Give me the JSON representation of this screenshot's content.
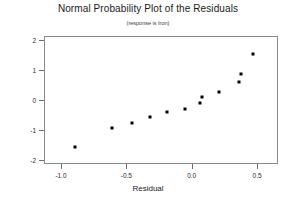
{
  "chart_data": {
    "type": "scatter",
    "title": "Normal Probability Plot of the Residuals",
    "subtitle": "(response is Iron)",
    "xlabel": "Residual",
    "ylabel": "",
    "xlim": [
      -1.13,
      0.66
    ],
    "ylim": [
      -2.13,
      2.13
    ],
    "grid": false,
    "legend": null,
    "x_ticks": [
      "-1.0",
      "-0.5",
      "0.0",
      "0.5"
    ],
    "x_tick_values": [
      -1.0,
      -0.5,
      0.0,
      0.5
    ],
    "y_ticks": [
      "2",
      "1",
      "0",
      "-1",
      "-2"
    ],
    "y_tick_values": [
      2,
      1,
      0,
      -1,
      -2
    ],
    "marker": "filled-square",
    "marker_color": "#000000",
    "points": [
      {
        "x": -0.89,
        "y": -1.57
      },
      {
        "x": -0.61,
        "y": -0.92
      },
      {
        "x": -0.46,
        "y": -0.77
      },
      {
        "x": -0.32,
        "y": -0.55
      },
      {
        "x": -0.19,
        "y": -0.41
      },
      {
        "x": -0.05,
        "y": -0.3
      },
      {
        "x": 0.06,
        "y": -0.09
      },
      {
        "x": 0.08,
        "y": 0.1
      },
      {
        "x": 0.21,
        "y": 0.28
      },
      {
        "x": 0.36,
        "y": 0.6
      },
      {
        "x": 0.38,
        "y": 0.88
      },
      {
        "x": 0.47,
        "y": 1.52
      }
    ]
  }
}
